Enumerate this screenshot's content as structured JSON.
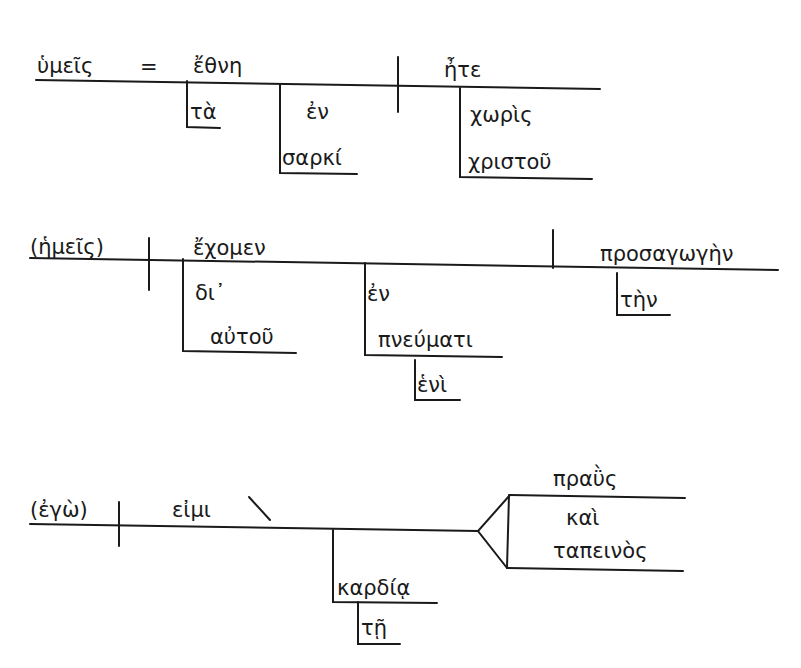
{
  "diagram": {
    "type": "Greek sentence diagram (Reed-Kellogg style)",
    "sentences": [
      {
        "subject": "ὑμεῖς",
        "equals": "=",
        "predicate_nominative": "ἔθνη",
        "verb": "ἦτε",
        "modifiers": {
          "article": "τὰ",
          "prep": "ἐν",
          "prep_object": "σαρκί",
          "adverb_prep": "χωρὶς",
          "adverb_object": "χριστοῦ"
        }
      },
      {
        "subject": "(ἡμεῖς)",
        "verb": "ἔχομεν",
        "object": "προσαγωγὴν",
        "modifiers": {
          "prep1": "δι᾽",
          "prep1_object": "αὐτοῦ",
          "prep2": "ἐν",
          "prep2_object": "πνεύματι",
          "prep2_object_mod": "ἑνὶ",
          "object_article": "τὴν"
        }
      },
      {
        "subject": "(ἐγὼ)",
        "verb": "εἰμι",
        "compound_predicate": {
          "first": "πραῢς",
          "conjunction": "καὶ",
          "second": "ταπεινὸς"
        },
        "modifiers": {
          "dative": "καρδίᾳ",
          "dative_article": "τῇ"
        }
      }
    ]
  }
}
